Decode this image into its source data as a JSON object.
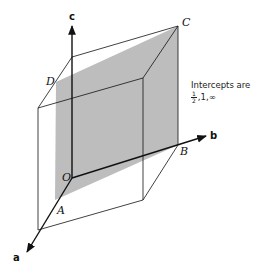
{
  "figure": {
    "axes": {
      "a": "a",
      "b": "b",
      "c": "c"
    },
    "points": {
      "origin": "O",
      "A": "A",
      "B": "B",
      "C": "C",
      "D": "D"
    },
    "note": {
      "line1": "Intercepts are",
      "half_num": "1",
      "half_den": "2",
      "rest": ",1,∞"
    },
    "colors": {
      "plane": "#bdbdbd",
      "lines": "#111111",
      "background": "#ffffff"
    }
  }
}
